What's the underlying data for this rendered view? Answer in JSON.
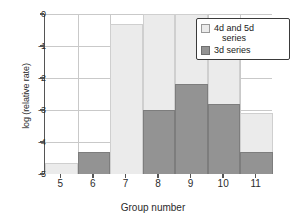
{
  "chart_data": {
    "type": "bar",
    "title": "",
    "xlabel": "Group number",
    "ylabel": "log (relative rate)",
    "categories": [
      "5",
      "6",
      "7",
      "8",
      "9",
      "10",
      "11"
    ],
    "ylim": [
      -5,
      0
    ],
    "yticks": [
      "0",
      "-1",
      "-2",
      "-3",
      "-4",
      "-5"
    ],
    "ytick_values": [
      0,
      -1,
      -2,
      -3,
      -4,
      -5
    ],
    "grid": true,
    "legend_position": "top-right",
    "series": [
      {
        "name": "4d and 5d series",
        "color": "#ebebeb",
        "values": [
          -4.65,
          -4.4,
          -0.3,
          0.0,
          0.0,
          -0.55,
          -3.1
        ]
      },
      {
        "name": "3d series",
        "color": "#939393",
        "values": [
          null,
          -4.3,
          null,
          -3.0,
          -2.2,
          -2.8,
          -4.3
        ]
      }
    ]
  },
  "legend": {
    "items": [
      {
        "label_line1": "4d and 5d",
        "label_line2": "series"
      },
      {
        "label_line1": "3d series",
        "label_line2": ""
      }
    ]
  },
  "axes": {
    "x_label": "Group number",
    "y_label": "log (relative rate)",
    "x_tick_labels": [
      "5",
      "6",
      "7",
      "8",
      "9",
      "10",
      "11"
    ],
    "y_tick_labels": [
      "0",
      "-1",
      "-2",
      "-3",
      "-4",
      "-5"
    ]
  },
  "colors": {
    "light_series": "#ebebeb",
    "dark_series": "#939393",
    "grid": "#c9c9c9",
    "axis": "#555555",
    "text": "#2b2b2b"
  }
}
